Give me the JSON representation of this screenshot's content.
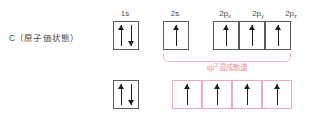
{
  "figure": {
    "species_label": "C（原子価状態）",
    "hybrid_label_base": "sp",
    "hybrid_label_exponent": "3",
    "hybrid_label_tail": " 混成軌道",
    "colors": {
      "box_border": "#5b5b5b",
      "hybrid_border": "#f2a9bb",
      "hybrid_text": "#ef8aa3",
      "bracket": "#f4b8c6",
      "arrow": "#1c1c1c",
      "background": "#ffffff",
      "text": "#4a4a4a"
    }
  },
  "top_row": {
    "orbitals": [
      {
        "label_base": "1s",
        "label_sub": "",
        "electrons": [
          "up",
          "down"
        ],
        "border": "gray"
      },
      {
        "label_base": "2s",
        "label_sub": "",
        "electrons": [
          "up"
        ],
        "border": "gray"
      },
      {
        "label_base": "2p",
        "label_sub": "x",
        "electrons": [
          "up"
        ],
        "border": "gray"
      },
      {
        "label_base": "2p",
        "label_sub": "y",
        "electrons": [
          "up"
        ],
        "border": "gray"
      },
      {
        "label_base": "2p",
        "label_sub": "z",
        "electrons": [
          "up"
        ],
        "border": "gray"
      }
    ]
  },
  "bottom_row": {
    "orbitals": [
      {
        "label_base": "",
        "label_sub": "",
        "electrons": [
          "up",
          "down"
        ],
        "border": "gray"
      },
      {
        "label_base": "",
        "label_sub": "",
        "electrons": [
          "up"
        ],
        "border": "pink"
      },
      {
        "label_base": "",
        "label_sub": "",
        "electrons": [
          "up"
        ],
        "border": "pink"
      },
      {
        "label_base": "",
        "label_sub": "",
        "electrons": [
          "up"
        ],
        "border": "pink"
      },
      {
        "label_base": "",
        "label_sub": "",
        "electrons": [
          "up"
        ],
        "border": "pink"
      }
    ]
  }
}
